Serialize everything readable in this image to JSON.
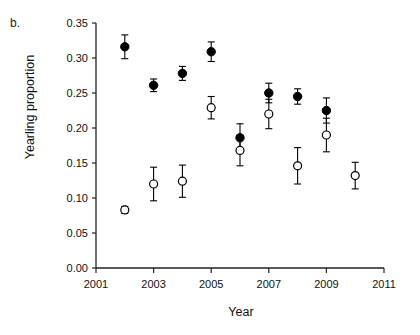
{
  "panel": {
    "label": "b."
  },
  "chart_data": {
    "type": "scatter",
    "title": "",
    "xlabel": "Year",
    "ylabel": "Yearling proportion",
    "xlim": [
      2001,
      2011
    ],
    "ylim": [
      0.0,
      0.35
    ],
    "xticks": [
      2001,
      2003,
      2005,
      2007,
      2009,
      2011
    ],
    "xticklabels": [
      "2001",
      "2003",
      "2005",
      "2007",
      "2009",
      "2011"
    ],
    "yticks": [
      0.0,
      0.05,
      0.1,
      0.15,
      0.2,
      0.25,
      0.3,
      0.35
    ],
    "yticklabels": [
      "0.00",
      "0.05",
      "0.10",
      "0.15",
      "0.20",
      "0.25",
      "0.30",
      "0.35"
    ],
    "grid": false,
    "legend": "none",
    "errorbars": true,
    "series": [
      {
        "name": "closed-circles",
        "marker": "filled-circle",
        "color": "#000000",
        "x": [
          2002,
          2003,
          2004,
          2005,
          2006,
          2007,
          2008,
          2009
        ],
        "y": [
          0.316,
          0.261,
          0.278,
          0.309,
          0.186,
          0.25,
          0.245,
          0.225
        ],
        "yerr": [
          0.017,
          0.009,
          0.01,
          0.014,
          0.02,
          0.014,
          0.011,
          0.018
        ]
      },
      {
        "name": "open-circles",
        "marker": "open-circle",
        "color": "#000000",
        "x": [
          2002,
          2003,
          2004,
          2005,
          2006,
          2007,
          2008,
          2009,
          2010
        ],
        "y": [
          0.083,
          0.12,
          0.124,
          0.229,
          0.168,
          0.22,
          0.146,
          0.19,
          0.132
        ],
        "yerr": [
          0.005,
          0.024,
          0.023,
          0.016,
          0.022,
          0.021,
          0.026,
          0.024,
          0.019
        ]
      }
    ]
  }
}
